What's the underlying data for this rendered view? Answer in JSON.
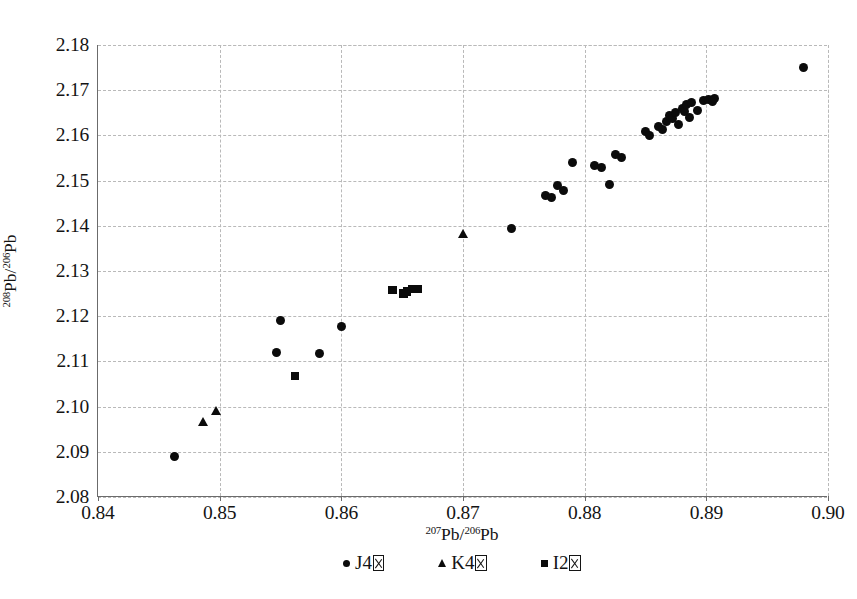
{
  "chart_data": {
    "type": "scatter",
    "title": "",
    "xlabel": "207Pb/206Pb",
    "ylabel": "208Pb/206Pb",
    "xlim": [
      0.84,
      0.9
    ],
    "ylim": [
      2.08,
      2.18
    ],
    "xticks": [
      "0.84",
      "0.85",
      "0.86",
      "0.87",
      "0.88",
      "0.89",
      "0.90"
    ],
    "yticks": [
      "2.08",
      "2.09",
      "2.10",
      "2.11",
      "2.12",
      "2.13",
      "2.14",
      "2.15",
      "2.16",
      "2.17",
      "2.18"
    ],
    "grid": true,
    "legend_position": "bottom",
    "series": [
      {
        "name": "J4",
        "marker": "circle",
        "points": [
          [
            0.8463,
            2.089
          ],
          [
            0.855,
            2.119
          ],
          [
            0.8547,
            2.112
          ],
          [
            0.8582,
            2.1118
          ],
          [
            0.86,
            2.1178
          ],
          [
            0.874,
            2.1395
          ],
          [
            0.8768,
            2.1468
          ],
          [
            0.8773,
            2.1462
          ],
          [
            0.8778,
            2.149
          ],
          [
            0.8783,
            2.1478
          ],
          [
            0.879,
            2.154
          ],
          [
            0.8808,
            2.1533
          ],
          [
            0.8814,
            2.153
          ],
          [
            0.882,
            2.1492
          ],
          [
            0.8825,
            2.1558
          ],
          [
            0.883,
            2.1552
          ],
          [
            0.885,
            2.1608
          ],
          [
            0.8853,
            2.16
          ],
          [
            0.8861,
            2.162
          ],
          [
            0.8864,
            2.1612
          ],
          [
            0.8867,
            2.163
          ],
          [
            0.887,
            2.1645
          ],
          [
            0.8872,
            2.1638
          ],
          [
            0.8875,
            2.165
          ],
          [
            0.8877,
            2.1625
          ],
          [
            0.888,
            2.166
          ],
          [
            0.8882,
            2.1652
          ],
          [
            0.8884,
            2.1668
          ],
          [
            0.8886,
            2.164
          ],
          [
            0.8888,
            2.1672
          ],
          [
            0.8893,
            2.1655
          ],
          [
            0.8898,
            2.1678
          ],
          [
            0.8902,
            2.168
          ],
          [
            0.8905,
            2.1676
          ],
          [
            0.8907,
            2.1682
          ],
          [
            0.898,
            2.175
          ]
        ]
      },
      {
        "name": "K4",
        "marker": "triangle",
        "points": [
          [
            0.8487,
            2.0965
          ],
          [
            0.8497,
            2.099
          ],
          [
            0.87,
            2.1382
          ]
        ]
      },
      {
        "name": "I2",
        "marker": "square",
        "points": [
          [
            0.8562,
            2.1068
          ],
          [
            0.8642,
            2.1258
          ],
          [
            0.8651,
            2.125
          ],
          [
            0.8654,
            2.1255
          ],
          [
            0.8658,
            2.126
          ],
          [
            0.8663,
            2.126
          ]
        ]
      }
    ]
  },
  "axis": {
    "x_title_pre": "207",
    "x_title_mid": "Pb/",
    "x_title_sup2": "206",
    "x_title_end": "Pb",
    "y_title_pre": "208",
    "y_title_mid": "Pb/",
    "y_title_sup2": "206",
    "y_title_end": "Pb"
  },
  "legend": {
    "items": [
      {
        "label": "J4",
        "marker": "circle"
      },
      {
        "label": "K4",
        "marker": "triangle"
      },
      {
        "label": "I2",
        "marker": "square"
      }
    ]
  },
  "style": {
    "marker_color": "#0b0b0b",
    "grid_color": "#b9b9b9",
    "axis_color": "#6b6b6b",
    "text_color": "#141414",
    "background": "#ffffff"
  }
}
